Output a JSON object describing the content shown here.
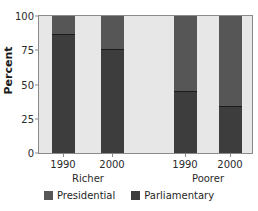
{
  "chart_data": {
    "type": "bar",
    "subtype": "stacked-100-percent",
    "title": "",
    "xlabel": "",
    "ylabel": "Percent",
    "ylim": [
      0,
      100
    ],
    "yticks": [
      0,
      25,
      50,
      75,
      100
    ],
    "ytick_labels": [
      "0",
      "25",
      "50",
      "75",
      "100"
    ],
    "grid": false,
    "legend_position": "bottom",
    "categories": [
      "1990",
      "2000",
      "1990",
      "2000"
    ],
    "groups": [
      {
        "label": "Richer",
        "categories": [
          "1990",
          "2000"
        ]
      },
      {
        "label": "Poorer",
        "categories": [
          "1990",
          "2000"
        ]
      }
    ],
    "series": [
      {
        "name": "Presidential",
        "color": "#565656",
        "values": [
          13,
          24,
          55,
          66
        ]
      },
      {
        "name": "Parliamentary",
        "color": "#3d3d3d",
        "values": [
          87,
          76,
          45,
          34
        ]
      }
    ],
    "bars": [
      {
        "group": "Richer",
        "year": "1990",
        "parliamentary": 87,
        "presidential": 13
      },
      {
        "group": "Richer",
        "year": "2000",
        "parliamentary": 76,
        "presidential": 24
      },
      {
        "group": "Poorer",
        "year": "1990",
        "parliamentary": 45,
        "presidential": 55
      },
      {
        "group": "Poorer",
        "year": "2000",
        "parliamentary": 34,
        "presidential": 66
      }
    ]
  },
  "axis": {
    "y_title": "Percent",
    "y_ticks": [
      "100",
      "75",
      "50",
      "25",
      "0"
    ],
    "x_ticks": [
      "1990",
      "2000",
      "1990",
      "2000"
    ],
    "group_labels": [
      "Richer",
      "Poorer"
    ]
  },
  "legend": {
    "items": [
      {
        "label": "Presidential",
        "color": "#565656"
      },
      {
        "label": "Parliamentary",
        "color": "#3d3d3d"
      }
    ]
  },
  "colors": {
    "plot_background": "#e7e7e7",
    "frame": "#8a8a8a",
    "presidential": "#565656",
    "parliamentary": "#3d3d3d",
    "text": "#2b2b2b",
    "page_background": "#ffffff"
  }
}
